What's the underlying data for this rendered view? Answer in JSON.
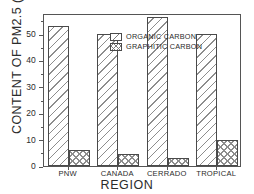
{
  "chart_data": {
    "type": "bar",
    "title": "",
    "xlabel": "REGION",
    "ylabel": "CONTENT OF PM2.5 (%)",
    "categories": [
      "PNW",
      "CANADA",
      "CERRADO",
      "TROPICAL"
    ],
    "series": [
      {
        "name": "ORGANIC CARBON",
        "values": [
          53,
          50,
          56.5,
          50
        ],
        "pattern": "diagonal-hatch"
      },
      {
        "name": "GRAPHITIC CARBON",
        "values": [
          6,
          4.5,
          3,
          10
        ],
        "pattern": "cross-hatch"
      }
    ],
    "ylim": [
      0,
      58
    ],
    "yticks": [
      0,
      10,
      20,
      30,
      40,
      50
    ],
    "ytick_labels": [
      "0",
      "10",
      "20",
      "30",
      "40",
      "50"
    ],
    "yminor_ticks": [
      5,
      15,
      25,
      35,
      45,
      55
    ],
    "grid": false,
    "legend_position": "upper-left-inside",
    "colors": {
      "axis": "#555555",
      "text": "#2b2b2b",
      "bar_edge": "#4a4a4a",
      "hatch": "#8d8d8d",
      "background": "#ffffff"
    }
  }
}
